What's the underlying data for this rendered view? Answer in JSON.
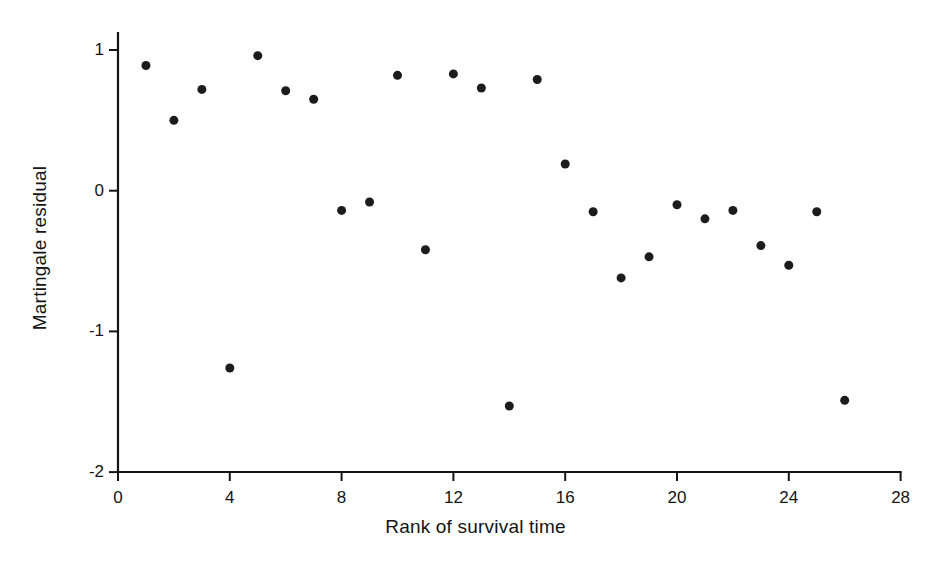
{
  "figure": {
    "background_color": "#ffffff",
    "foreground_color": "#141414"
  },
  "axes": {
    "x_title": "Rank of survival time",
    "y_title": "Martingale residual",
    "x_ticks": [
      "0",
      "4",
      "8",
      "12",
      "16",
      "20",
      "24",
      "28"
    ],
    "y_ticks": [
      "1",
      "0",
      "-1",
      "-2"
    ]
  },
  "chart_data": {
    "type": "scatter",
    "title": "",
    "subtitle": "",
    "xlabel": "Rank of survival time",
    "ylabel": "Martingale residual",
    "xlim": [
      0,
      28
    ],
    "ylim": [
      -2,
      1.12
    ],
    "xticks": [
      0,
      4,
      8,
      12,
      16,
      20,
      24,
      28
    ],
    "yticks": [
      1,
      0,
      -1,
      -2
    ],
    "grid": false,
    "legend": null,
    "marker": {
      "shape": "circle",
      "color": "#1c1c1c",
      "size_px": 9
    },
    "x": [
      1,
      2,
      3,
      4,
      5,
      6,
      7,
      8,
      9,
      10,
      11,
      12,
      13,
      14,
      15,
      16,
      17,
      18,
      19,
      20,
      21,
      22,
      23,
      24,
      25,
      26
    ],
    "y": [
      0.89,
      0.5,
      0.72,
      -1.26,
      0.96,
      0.71,
      0.65,
      -0.14,
      -0.08,
      0.82,
      -0.42,
      0.83,
      0.73,
      -1.53,
      0.79,
      0.19,
      -0.15,
      -0.62,
      -0.47,
      -0.1,
      -0.2,
      -0.14,
      -0.39,
      -0.53,
      -0.15,
      -1.49
    ],
    "points": [
      {
        "rank": 1,
        "residual": 0.89
      },
      {
        "rank": 2,
        "residual": 0.5
      },
      {
        "rank": 3,
        "residual": 0.72
      },
      {
        "rank": 4,
        "residual": -1.26
      },
      {
        "rank": 5,
        "residual": 0.96
      },
      {
        "rank": 6,
        "residual": 0.71
      },
      {
        "rank": 7,
        "residual": 0.65
      },
      {
        "rank": 8,
        "residual": -0.14
      },
      {
        "rank": 9,
        "residual": -0.08
      },
      {
        "rank": 10,
        "residual": 0.82
      },
      {
        "rank": 11,
        "residual": -0.42
      },
      {
        "rank": 12,
        "residual": 0.83
      },
      {
        "rank": 13,
        "residual": 0.73
      },
      {
        "rank": 14,
        "residual": -1.53
      },
      {
        "rank": 15,
        "residual": 0.79
      },
      {
        "rank": 16,
        "residual": 0.19
      },
      {
        "rank": 17,
        "residual": -0.15
      },
      {
        "rank": 18,
        "residual": -0.62
      },
      {
        "rank": 19,
        "residual": -0.47
      },
      {
        "rank": 20,
        "residual": -0.1
      },
      {
        "rank": 21,
        "residual": -0.2
      },
      {
        "rank": 22,
        "residual": -0.14
      },
      {
        "rank": 23,
        "residual": -0.39
      },
      {
        "rank": 24,
        "residual": -0.53
      },
      {
        "rank": 25,
        "residual": -0.15
      },
      {
        "rank": 26,
        "residual": -1.49
      }
    ]
  },
  "geometry": {
    "origin_x_px": 118,
    "origin_y_px": 472,
    "px_per_x_unit": 27.95,
    "px_per_y_unit": 140.7,
    "y_top_value": 1.0,
    "y_top_px": 50
  }
}
